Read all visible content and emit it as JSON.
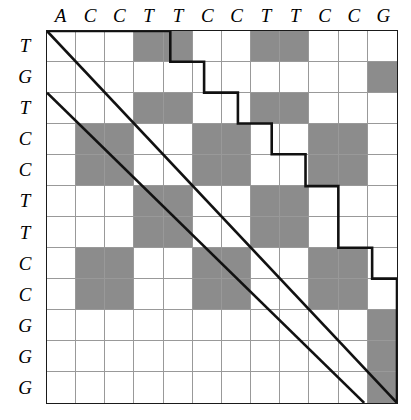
{
  "figure": {
    "type": "dot-plot-matrix",
    "columns": [
      "A",
      "C",
      "C",
      "T",
      "T",
      "C",
      "C",
      "T",
      "T",
      "C",
      "C",
      "G"
    ],
    "rows": [
      "T",
      "G",
      "T",
      "C",
      "C",
      "T",
      "T",
      "C",
      "C",
      "G",
      "G",
      "G"
    ],
    "column_sequence": "ACCTTCCTTCCG",
    "row_sequence": "TGTCCTTCCGGG",
    "grid_size": {
      "columns": 12,
      "rows": 12
    },
    "colors": {
      "match_fill": "#8c8c8c",
      "no_match_fill": "#ffffff",
      "grid_line": "#999999",
      "border": "#1a1a1a",
      "path_line": "#111111"
    },
    "matches": [
      [
        0,
        0,
        0,
        1,
        1,
        0,
        0,
        1,
        1,
        0,
        0,
        0
      ],
      [
        0,
        0,
        0,
        0,
        0,
        0,
        0,
        0,
        0,
        0,
        0,
        1
      ],
      [
        0,
        0,
        0,
        1,
        1,
        0,
        0,
        1,
        1,
        0,
        0,
        0
      ],
      [
        0,
        1,
        1,
        0,
        0,
        1,
        1,
        0,
        0,
        1,
        1,
        0
      ],
      [
        0,
        1,
        1,
        0,
        0,
        1,
        1,
        0,
        0,
        1,
        1,
        0
      ],
      [
        0,
        0,
        0,
        1,
        1,
        0,
        0,
        1,
        1,
        0,
        0,
        0
      ],
      [
        0,
        0,
        0,
        1,
        1,
        0,
        0,
        1,
        1,
        0,
        0,
        0
      ],
      [
        0,
        1,
        1,
        0,
        0,
        1,
        1,
        0,
        0,
        1,
        1,
        0
      ],
      [
        0,
        1,
        1,
        0,
        0,
        1,
        1,
        0,
        0,
        1,
        1,
        0
      ],
      [
        0,
        0,
        0,
        0,
        0,
        0,
        0,
        0,
        0,
        0,
        0,
        1
      ],
      [
        0,
        0,
        0,
        0,
        0,
        0,
        0,
        0,
        0,
        0,
        0,
        1
      ],
      [
        0,
        0,
        0,
        0,
        0,
        0,
        0,
        0,
        0,
        0,
        0,
        1
      ]
    ],
    "paths": [
      {
        "name": "upper-alignment-path",
        "points": "0,0 124,0 124,31 158,31 158,62 192,62 192,93 226,93 226,124 260,124 260,156 293,156 293,187 293,218 327,218 327,249 352,249 352,374"
      },
      {
        "name": "main-diagonal-path",
        "points": "0,0 352,374"
      },
      {
        "name": "secondary-diagonal-path",
        "points": "0,62 319,374"
      }
    ]
  }
}
